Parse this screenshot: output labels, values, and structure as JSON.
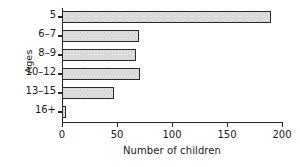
{
  "chart_data": {
    "type": "bar",
    "orientation": "horizontal",
    "title": "",
    "xlabel": "Number of children",
    "ylabel": "Ages",
    "categories": [
      "5",
      "6–7",
      "8–9",
      "10–12",
      "13–15",
      "16+"
    ],
    "values": [
      190,
      70,
      67,
      71,
      47,
      4
    ],
    "xlim": [
      0,
      200
    ],
    "xticks": [
      0,
      50,
      100,
      150,
      200
    ],
    "xtick_labels": [
      "0",
      "50",
      "100",
      "150",
      "200"
    ],
    "grid": false,
    "legend": null,
    "bar_fill_color": "#d2d2d2",
    "bar_edge_color": "#2b2b2b",
    "axis_color": "#262626",
    "background_color": "#ffffff"
  }
}
